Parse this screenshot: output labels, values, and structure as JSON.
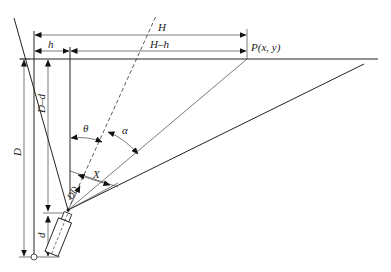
{
  "diagram": {
    "labels": {
      "H": "H",
      "h": "h",
      "H_minus_h": "H–h",
      "point": "P(x, y)",
      "D": "D",
      "D_minus_d": "D–d",
      "d": "d",
      "theta": "θ",
      "alpha": "α",
      "X": "X",
      "DD": "DD"
    },
    "colors": {
      "line": "#222222",
      "background": "#ffffff"
    }
  }
}
